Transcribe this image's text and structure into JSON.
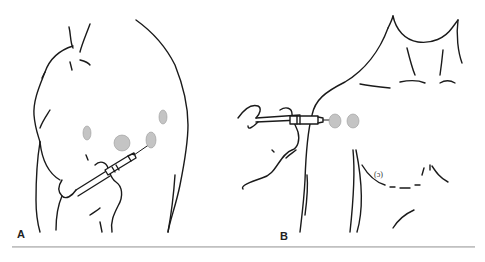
{
  "figure": {
    "panels": [
      {
        "label": "A",
        "view": "posterior shoulder",
        "injection_sites": 4,
        "colors": {
          "site": "#c4c4c4",
          "line": "#1a1a1a"
        }
      },
      {
        "label": "B",
        "view": "anterior shoulder / chest",
        "injection_sites": 2,
        "chest_mark": "(ɔ)",
        "colors": {
          "site": "#c4c4c4",
          "line": "#1a1a1a"
        }
      }
    ]
  }
}
